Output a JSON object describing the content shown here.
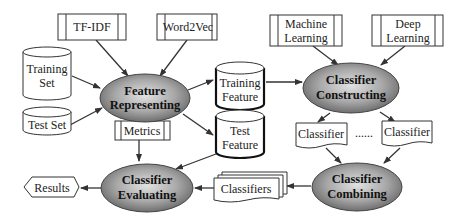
{
  "diagram": {
    "tools": {
      "tfidf": "TF-IDF",
      "word2vec": "Word2Vec",
      "ml_line1": "Machine",
      "ml_line2": "Learning",
      "dl_line1": "Deep",
      "dl_line2": "Learning",
      "metrics": "Metrics"
    },
    "data_stores": {
      "training_set_line1": "Training",
      "training_set_line2": "Set",
      "test_set": "Test Set",
      "training_feature_line1": "Training",
      "training_feature_line2": "Feature",
      "test_feature_line1": "Test",
      "test_feature_line2": "Feature"
    },
    "processes": {
      "feature_line1": "Feature",
      "feature_line2": "Representing",
      "constructing_line1": "Classifier",
      "constructing_line2": "Constructing",
      "combining_line1": "Classifier",
      "combining_line2": "Combining",
      "evaluating_line1": "Classifier",
      "evaluating_line2": "Evaluating"
    },
    "documents": {
      "classifier_a": "Classifier",
      "ellipsis": "......",
      "classifier_b": "Classifier",
      "classifiers": "Classifiers"
    },
    "outputs": {
      "results": "Results"
    }
  }
}
